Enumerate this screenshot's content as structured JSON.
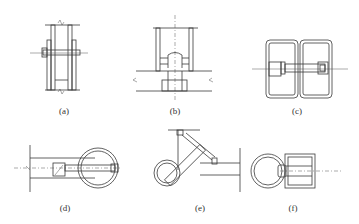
{
  "figure": {
    "panels": [
      {
        "id": "a",
        "label": "(a)",
        "content": "Two-sided tube wall with through bolt"
      },
      {
        "id": "b",
        "label": "(b)",
        "content": "Tube on base plate with bolt and nut"
      },
      {
        "id": "c",
        "label": "(c)",
        "content": "Two rectangular hollow sections joined with bolt"
      },
      {
        "id": "d",
        "label": "(d)",
        "content": "Circular tube bolted to flat member"
      },
      {
        "id": "e",
        "label": "(e)",
        "content": "Inclined circular tube bolted to corner bracket"
      },
      {
        "id": "f",
        "label": "(f)",
        "content": "Circular tube bolted to rectangular hollow section"
      }
    ]
  }
}
